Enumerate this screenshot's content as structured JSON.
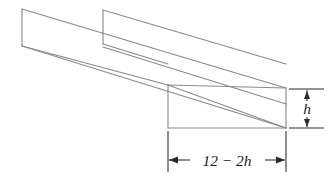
{
  "figure": {
    "background_color": "#ffffff",
    "edge_color": "#8a8a8a",
    "dimension_color": "#2a2a2a",
    "text_color": "#1a1a1a"
  },
  "labels": {
    "height": {
      "text": "h",
      "orientation": "vertical",
      "position": "right-side"
    },
    "width": {
      "text": "12  −  2h",
      "parts": {
        "total": "12",
        "minus": "−",
        "subtracted": "2h"
      },
      "orientation": "horizontal",
      "position": "bottom"
    }
  },
  "geometry": {
    "far_left_top": [
      22,
      9
    ],
    "far_left_bottom": [
      22,
      46
    ],
    "inner_wall_top": [
      103,
      10
    ],
    "inner_wall_bottom": [
      103,
      44
    ],
    "near_left_bottom": [
      168,
      128
    ],
    "near_left_top": [
      168,
      85
    ],
    "near_right_bottom": [
      286,
      128
    ],
    "near_right_top": [
      286,
      88
    ]
  }
}
